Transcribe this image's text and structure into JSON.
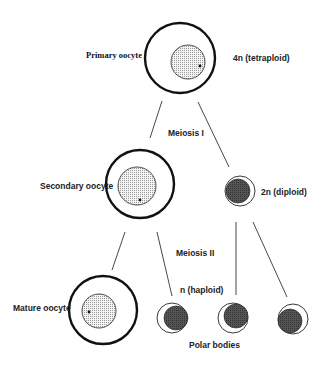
{
  "diagram": {
    "labels": {
      "primary_oocyte": "Primary oocyte",
      "tetraploid": "4n (tetraploid)",
      "meiosis_1": "Meiosis I",
      "secondary_oocyte": "Secondary oocyte",
      "diploid": "2n (diploid)",
      "meiosis_2": "Meiosis II",
      "haploid": "n (haploid)",
      "mature_oocyte": "Mature oocyte",
      "polar_bodies": "Polar bodies"
    },
    "colors": {
      "outline": "#111111",
      "nucleus_fill": "#e4e4e4",
      "polar_body_fill": "#4a4a4a",
      "line": "#333333"
    },
    "nodes": [
      {
        "id": "primary-oocyte",
        "type": "oocyte",
        "cx": 180,
        "cy": 58,
        "r": 35
      },
      {
        "id": "secondary-oocyte",
        "type": "oocyte",
        "cx": 140,
        "cy": 183,
        "r": 34
      },
      {
        "id": "mature-oocyte",
        "type": "oocyte",
        "cx": 103,
        "cy": 310,
        "r": 34
      },
      {
        "id": "polar-body-1",
        "type": "polar-body",
        "cx": 240,
        "cy": 191,
        "r": 15
      },
      {
        "id": "polar-body-2",
        "type": "polar-body",
        "cx": 172,
        "cy": 318,
        "r": 15
      },
      {
        "id": "polar-body-3",
        "type": "polar-body",
        "cx": 233,
        "cy": 318,
        "r": 15
      },
      {
        "id": "polar-body-4",
        "type": "polar-body",
        "cx": 293,
        "cy": 319,
        "r": 15
      }
    ],
    "edges": [
      {
        "from": "primary-oocyte",
        "to": "secondary-oocyte"
      },
      {
        "from": "primary-oocyte",
        "to": "polar-body-1"
      },
      {
        "from": "secondary-oocyte",
        "to": "mature-oocyte"
      },
      {
        "from": "secondary-oocyte",
        "to": "polar-body-2"
      },
      {
        "from": "polar-body-1",
        "to": "polar-body-3"
      },
      {
        "from": "polar-body-1",
        "to": "polar-body-4"
      }
    ]
  }
}
